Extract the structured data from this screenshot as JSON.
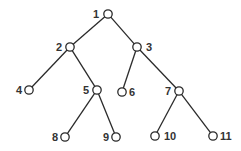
{
  "diagram": {
    "type": "binary-tree",
    "colors": {
      "line": "#2a2a2a",
      "text": "#333333",
      "background": "#ffffff"
    },
    "nodes": [
      {
        "id": "1",
        "label": "1",
        "x": 108,
        "y": 14,
        "lx": 93,
        "ly": 18,
        "anchor": "start"
      },
      {
        "id": "2",
        "label": "2",
        "x": 70,
        "y": 47,
        "lx": 56,
        "ly": 51,
        "anchor": "start"
      },
      {
        "id": "3",
        "label": "3",
        "x": 137,
        "y": 47,
        "lx": 146,
        "ly": 51,
        "anchor": "start"
      },
      {
        "id": "4",
        "label": "4",
        "x": 29,
        "y": 90,
        "lx": 16,
        "ly": 94,
        "anchor": "start"
      },
      {
        "id": "5",
        "label": "5",
        "x": 97,
        "y": 90,
        "lx": 83,
        "ly": 94,
        "anchor": "start"
      },
      {
        "id": "6",
        "label": "6",
        "x": 122,
        "y": 92,
        "lx": 129,
        "ly": 96,
        "anchor": "start"
      },
      {
        "id": "7",
        "label": "7",
        "x": 179,
        "y": 91,
        "lx": 165,
        "ly": 95,
        "anchor": "start"
      },
      {
        "id": "8",
        "label": "8",
        "x": 65,
        "y": 137,
        "lx": 52,
        "ly": 141,
        "anchor": "start"
      },
      {
        "id": "9",
        "label": "9",
        "x": 116,
        "y": 137,
        "lx": 103,
        "ly": 141,
        "anchor": "start"
      },
      {
        "id": "10",
        "label": "10",
        "x": 155,
        "y": 136,
        "lx": 164,
        "ly": 140,
        "anchor": "start"
      },
      {
        "id": "11",
        "label": "11",
        "x": 213,
        "y": 136,
        "lx": 220,
        "ly": 140,
        "anchor": "start"
      }
    ],
    "edges": [
      [
        "1",
        "2"
      ],
      [
        "1",
        "3"
      ],
      [
        "2",
        "4"
      ],
      [
        "2",
        "5"
      ],
      [
        "3",
        "6"
      ],
      [
        "3",
        "7"
      ],
      [
        "5",
        "8"
      ],
      [
        "5",
        "9"
      ],
      [
        "7",
        "10"
      ],
      [
        "7",
        "11"
      ]
    ]
  }
}
